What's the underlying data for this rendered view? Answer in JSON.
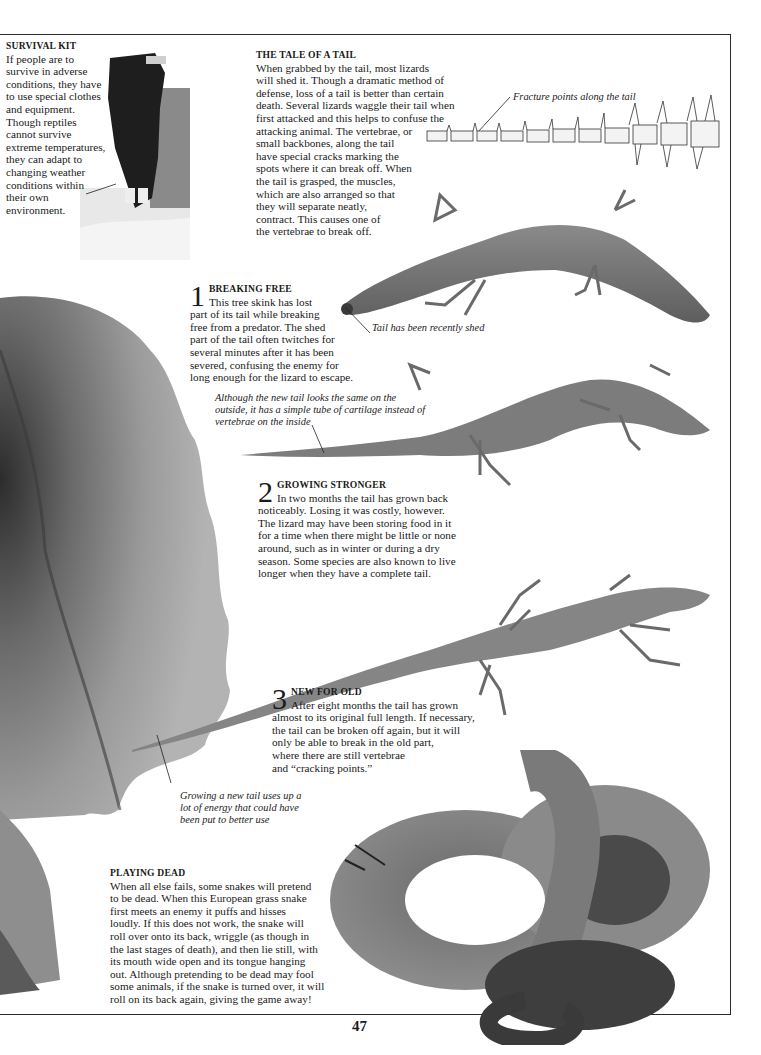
{
  "page": {
    "number": "47",
    "colors": {
      "text": "#1a1a1a",
      "rule": "#2a2a2a",
      "background": "#ffffff"
    }
  },
  "survival_kit": {
    "heading": "SURVIVAL KIT",
    "lines": [
      "If people are to",
      "survive in adverse",
      "conditions, they have",
      "to use special clothes",
      "and equipment.",
      "Though reptiles",
      "cannot survive",
      "extreme temperatures,",
      "they can adapt to",
      "changing weather",
      "conditions within",
      "their own",
      "environment."
    ],
    "image": "mountaineer-photo"
  },
  "tale_of_a_tail": {
    "heading": "THE TALE OF A TAIL",
    "lines": [
      "When grabbed by the tail, most lizards",
      "will shed it. Though a dramatic method of",
      "defense, loss of a tail is better than certain",
      "death. Several lizards waggle their tail when",
      "first attacked and this helps to confuse the",
      "attacking animal. The vertebrae, or",
      "small backbones, along the tail",
      "have special cracks marking the",
      "spots where it can break off. When",
      "the tail is grasped, the muscles,",
      "which are also arranged so that",
      "they will separate neatly,",
      "contract. This causes one of",
      "the vertebrae to break off."
    ],
    "diagram_caption": "Fracture points along the tail",
    "image": "tail-vertebrae-diagram"
  },
  "breaking_free": {
    "number": "1",
    "heading": "BREAKING FREE",
    "first_line": "This tree skink has lost",
    "lines": [
      "part of its tail while breaking",
      "free from a predator. The shed",
      "part of the tail often twitches for",
      "several minutes after it has been",
      "severed, confusing the enemy for",
      "long enough for the lizard to escape."
    ],
    "caption": "Tail has been recently shed",
    "image": "skink-shed-tail-photo"
  },
  "cartilage_caption": {
    "lines": [
      "Although the new tail looks the same  on the",
      "outside, it has a simple tube of cartilage instead of",
      "vertebrae on the inside"
    ]
  },
  "growing_stronger": {
    "number": "2",
    "heading": "GROWING STRONGER",
    "first_line": "In two months the tail has grown back",
    "lines": [
      "noticeably. Losing it was costly, however.",
      "The lizard may have been storing food in it",
      "for a time when there might be little or none",
      "around, such as in winter or during a dry",
      "season. Some species are also known to live",
      "longer when they have a complete tail."
    ],
    "image": "skink-two-months-photo"
  },
  "new_for_old": {
    "number": "3",
    "heading": "NEW FOR OLD",
    "first_line": "After eight months the tail has grown",
    "lines": [
      "almost to its original full length. If necessary,",
      "the tail can be broken off again, but it will",
      "only be able to break in the old part,",
      "where there are still vertebrae",
      "and “cracking points.”"
    ],
    "image": "skink-eight-months-photo"
  },
  "energy_caption": {
    "lines": [
      "Growing a new tail uses up a",
      "lot of energy that could have",
      "been put to better use"
    ]
  },
  "playing_dead": {
    "heading": "PLAYING DEAD",
    "lines": [
      "When all else fails, some snakes will pretend",
      "to be dead. When this European grass snake",
      "first meets an enemy it puffs and hisses",
      "loudly. If this does not work, the snake will",
      "roll over onto its back, wriggle (as though in",
      "the last stages of death), and then lie still, with",
      "its mouth wide open and its tongue hanging",
      "out. Although pretending to be dead may fool",
      "some animals, if the snake is turned over, it will",
      "roll on its back again, giving the game away!"
    ],
    "image": "grass-snake-photo"
  },
  "frilled_lizard": {
    "image": "frilled-lizard-frill-photo"
  }
}
